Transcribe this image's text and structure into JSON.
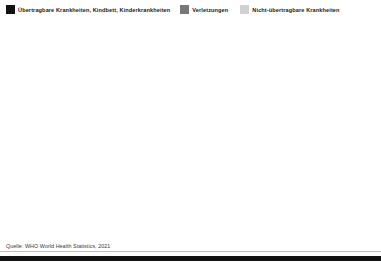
{
  "legend": {
    "items": [
      {
        "label": "Übertragbare Krankheiten, Kindbett, Kinderkrankheiten",
        "color": "#111111",
        "key": "communicable"
      },
      {
        "label": "Verletzungen",
        "color": "#77787b",
        "key": "injuries"
      },
      {
        "label": "Nicht-übertragbare Krankheiten",
        "color": "#cfd0d1",
        "key": "noncommunicable"
      }
    ]
  },
  "axis": {
    "y_ticks": [
      "100 %",
      "50",
      "0"
    ],
    "y_tick_values": [
      100,
      50,
      0
    ],
    "gridline_values": [
      100,
      75,
      50,
      25,
      0
    ],
    "x_ticks": [
      "2000",
      "2010",
      "2019"
    ]
  },
  "source": {
    "text": "Quelle: WHO World Health Statistics, 2021"
  },
  "chart_data": {
    "type": "area",
    "title": "",
    "subtitle": "",
    "xlabel": "",
    "ylabel": "",
    "ylim": [
      0,
      100
    ],
    "stacked": true,
    "normalized": true,
    "grid": true,
    "legend_position": "top",
    "x": [
      2000,
      2010,
      2019
    ],
    "x_tick_labels": [
      "2000",
      "2010",
      "2019"
    ],
    "series_names": [
      "Übertragbare Krankheiten, Kindbett, Kinderkrankheiten",
      "Verletzungen",
      "Nicht-übertragbare Krankheiten"
    ],
    "series_colors": [
      "#111111",
      "#77787b",
      "#cfd0d1"
    ],
    "panels": [
      {
        "name": "Afrika",
        "series": [
          {
            "name": "Übertragbare Krankheiten, Kindbett, Kinderkrankheiten",
            "values": [
              72,
              64,
              55
            ]
          },
          {
            "name": "Verletzungen",
            "values": [
              8,
              8,
              7
            ]
          },
          {
            "name": "Nicht-übertragbare Krankheiten",
            "values": [
              20,
              28,
              38
            ]
          }
        ]
      },
      {
        "name": "Amerika",
        "series": [
          {
            "name": "Übertragbare Krankheiten, Kindbett, Kinderkrankheiten",
            "values": [
              12,
              10,
              8
            ]
          },
          {
            "name": "Verletzungen",
            "values": [
              10,
              9,
              9
            ]
          },
          {
            "name": "Nicht-übertragbare Krankheiten",
            "values": [
              78,
              81,
              83
            ]
          }
        ]
      },
      {
        "name": "Östliches Mittelmeer",
        "series": [
          {
            "name": "Übertragbare Krankheiten, Kindbett, Kinderkrankheiten",
            "values": [
              37,
              27,
              20
            ]
          },
          {
            "name": "Verletzungen",
            "values": [
              7,
              7,
              7
            ]
          },
          {
            "name": "Nicht-übertragbare Krankheiten",
            "values": [
              56,
              66,
              73
            ]
          }
        ]
      },
      {
        "name": "Europa",
        "series": [
          {
            "name": "Übertragbare Krankheiten, Kindbett, Kinderkrankheiten",
            "values": [
              3,
              3,
              2
            ]
          },
          {
            "name": "Verletzungen",
            "values": [
              9,
              9,
              8
            ]
          },
          {
            "name": "Nicht-übertragbare Krankheiten",
            "values": [
              88,
              88,
              90
            ]
          }
        ]
      },
      {
        "name": "Südost-Asien",
        "series": [
          {
            "name": "Übertragbare Krankheiten, Kindbett, Kinderkrankheiten",
            "values": [
              40,
              27,
              18
            ]
          },
          {
            "name": "Verletzungen",
            "values": [
              10,
              10,
              9
            ]
          },
          {
            "name": "Nicht-übertragbare Krankheiten",
            "values": [
              50,
              63,
              73
            ]
          }
        ]
      },
      {
        "name": "Westlicher Pazifik",
        "series": [
          {
            "name": "Übertragbare Krankheiten, Kindbett, Kinderkrankheiten",
            "values": [
              10,
              7,
              5
            ]
          },
          {
            "name": "Verletzungen",
            "values": [
              8,
              8,
              7
            ]
          },
          {
            "name": "Nicht-übertragbare Krankheiten",
            "values": [
              82,
              85,
              88
            ]
          }
        ]
      }
    ]
  }
}
